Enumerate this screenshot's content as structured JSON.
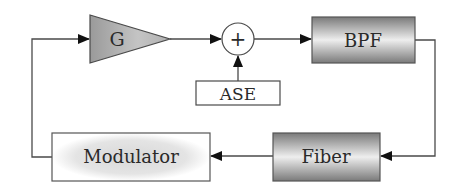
{
  "diagram": {
    "title": "",
    "blocks": {
      "gain": {
        "label": "G",
        "shape": "triangle"
      },
      "sum": {
        "label": "+",
        "shape": "circle"
      },
      "ase": {
        "label": "ASE",
        "shape": "rect"
      },
      "bpf": {
        "label": "BPF",
        "shape": "rect-gradient"
      },
      "fiber": {
        "label": "Fiber",
        "shape": "rect-gradient"
      },
      "modulator": {
        "label": "Modulator",
        "shape": "rect-radial"
      }
    },
    "connections": [
      {
        "from": "gain",
        "to": "sum"
      },
      {
        "from": "ase",
        "to": "sum"
      },
      {
        "from": "sum",
        "to": "bpf"
      },
      {
        "from": "bpf",
        "to": "fiber"
      },
      {
        "from": "fiber",
        "to": "modulator"
      },
      {
        "from": "modulator",
        "to": "gain"
      }
    ],
    "colors": {
      "line": "#4a4a4a",
      "arrow": "#111111",
      "box_border": "#555555"
    }
  }
}
